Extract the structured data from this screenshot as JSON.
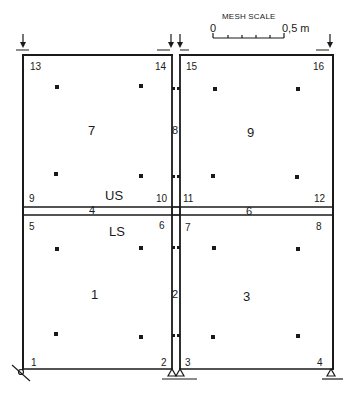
{
  "diagram": {
    "type": "finite-element-mesh"
  },
  "scale": {
    "title": "MESH SCALE",
    "start_label": "0",
    "end_label": "0,5 m"
  },
  "zones": {
    "upper": "US",
    "lower": "LS"
  },
  "nodes": [
    {
      "id": "1",
      "label": "1"
    },
    {
      "id": "2",
      "label": "2"
    },
    {
      "id": "3",
      "label": "3"
    },
    {
      "id": "4",
      "label": "4"
    },
    {
      "id": "5",
      "label": "5"
    },
    {
      "id": "6",
      "label": "6"
    },
    {
      "id": "7",
      "label": "7"
    },
    {
      "id": "8",
      "label": "8"
    },
    {
      "id": "9",
      "label": "9"
    },
    {
      "id": "10",
      "label": "10"
    },
    {
      "id": "11",
      "label": "11"
    },
    {
      "id": "12",
      "label": "12"
    },
    {
      "id": "13",
      "label": "13"
    },
    {
      "id": "14",
      "label": "14"
    },
    {
      "id": "15",
      "label": "15"
    },
    {
      "id": "16",
      "label": "16"
    }
  ],
  "elements": [
    {
      "id": "1",
      "label": "1",
      "kind": "panel"
    },
    {
      "id": "2",
      "label": "2",
      "kind": "column"
    },
    {
      "id": "3",
      "label": "3",
      "kind": "panel"
    },
    {
      "id": "4",
      "label": "4",
      "kind": "beam"
    },
    {
      "id": "5",
      "label": "5",
      "kind": "joint"
    },
    {
      "id": "6",
      "label": "6",
      "kind": "beam"
    },
    {
      "id": "7",
      "label": "7",
      "kind": "panel"
    },
    {
      "id": "8",
      "label": "8",
      "kind": "column"
    },
    {
      "id": "9",
      "label": "9",
      "kind": "panel"
    }
  ],
  "loads": {
    "count": 4,
    "direction": "down",
    "locations": [
      "node 13",
      "node 14",
      "node 15",
      "node 16"
    ]
  },
  "supports": [
    {
      "node": "1",
      "type": "inclined roller"
    },
    {
      "node": "2",
      "type": "pin"
    },
    {
      "node": "3",
      "type": "pin"
    },
    {
      "node": "4",
      "type": "pin"
    }
  ],
  "colors": {
    "line": "#1a1a1a",
    "background": "#ffffff"
  }
}
